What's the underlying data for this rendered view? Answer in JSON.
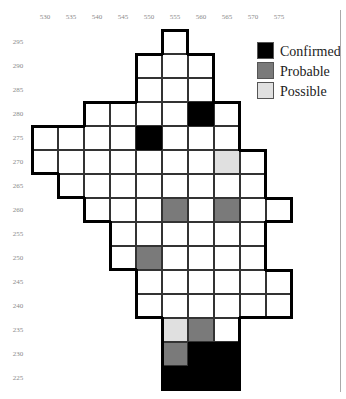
{
  "chart_data": {
    "type": "heatmap",
    "title": "",
    "xlabel": "",
    "ylabel": "",
    "x_ticks": [
      530,
      535,
      540,
      545,
      550,
      555,
      560,
      565,
      570,
      575
    ],
    "y_ticks": [
      295,
      290,
      285,
      280,
      275,
      270,
      265,
      260,
      255,
      250,
      245,
      240,
      235,
      230,
      225
    ],
    "grid": true,
    "legend_position": "top-right",
    "legend": [
      {
        "label": "Confirmed",
        "color": "#000000",
        "key": "confirmed"
      },
      {
        "label": "Probable",
        "color": "#7a7a7a",
        "key": "probable"
      },
      {
        "label": "Possible",
        "color": "#e0e0e0",
        "key": "possible"
      }
    ],
    "rows": [
      {
        "y": 295,
        "cells": [
          {
            "x": 555,
            "s": "none"
          }
        ]
      },
      {
        "y": 290,
        "cells": [
          {
            "x": 550,
            "s": "none"
          },
          {
            "x": 555,
            "s": "none"
          },
          {
            "x": 560,
            "s": "none"
          }
        ]
      },
      {
        "y": 285,
        "cells": [
          {
            "x": 550,
            "s": "none"
          },
          {
            "x": 555,
            "s": "none"
          },
          {
            "x": 560,
            "s": "none"
          }
        ]
      },
      {
        "y": 280,
        "cells": [
          {
            "x": 540,
            "s": "none"
          },
          {
            "x": 545,
            "s": "none"
          },
          {
            "x": 550,
            "s": "none"
          },
          {
            "x": 555,
            "s": "none"
          },
          {
            "x": 560,
            "s": "confirmed"
          },
          {
            "x": 565,
            "s": "none"
          }
        ]
      },
      {
        "y": 275,
        "cells": [
          {
            "x": 530,
            "s": "none"
          },
          {
            "x": 535,
            "s": "none"
          },
          {
            "x": 540,
            "s": "none"
          },
          {
            "x": 545,
            "s": "none"
          },
          {
            "x": 550,
            "s": "confirmed"
          },
          {
            "x": 555,
            "s": "none"
          },
          {
            "x": 560,
            "s": "none"
          },
          {
            "x": 565,
            "s": "none"
          }
        ]
      },
      {
        "y": 270,
        "cells": [
          {
            "x": 530,
            "s": "none"
          },
          {
            "x": 535,
            "s": "none"
          },
          {
            "x": 540,
            "s": "none"
          },
          {
            "x": 545,
            "s": "none"
          },
          {
            "x": 550,
            "s": "none"
          },
          {
            "x": 555,
            "s": "none"
          },
          {
            "x": 560,
            "s": "none"
          },
          {
            "x": 565,
            "s": "possible"
          },
          {
            "x": 570,
            "s": "none"
          }
        ]
      },
      {
        "y": 265,
        "cells": [
          {
            "x": 535,
            "s": "none"
          },
          {
            "x": 540,
            "s": "none"
          },
          {
            "x": 545,
            "s": "none"
          },
          {
            "x": 550,
            "s": "none"
          },
          {
            "x": 555,
            "s": "none"
          },
          {
            "x": 560,
            "s": "none"
          },
          {
            "x": 565,
            "s": "none"
          },
          {
            "x": 570,
            "s": "none"
          }
        ]
      },
      {
        "y": 260,
        "cells": [
          {
            "x": 540,
            "s": "none"
          },
          {
            "x": 545,
            "s": "none"
          },
          {
            "x": 550,
            "s": "none"
          },
          {
            "x": 555,
            "s": "probable"
          },
          {
            "x": 560,
            "s": "none"
          },
          {
            "x": 565,
            "s": "probable"
          },
          {
            "x": 570,
            "s": "none"
          },
          {
            "x": 575,
            "s": "none"
          }
        ]
      },
      {
        "y": 255,
        "cells": [
          {
            "x": 545,
            "s": "none"
          },
          {
            "x": 550,
            "s": "none"
          },
          {
            "x": 555,
            "s": "none"
          },
          {
            "x": 560,
            "s": "none"
          },
          {
            "x": 565,
            "s": "none"
          },
          {
            "x": 570,
            "s": "none"
          }
        ]
      },
      {
        "y": 250,
        "cells": [
          {
            "x": 545,
            "s": "none"
          },
          {
            "x": 550,
            "s": "probable"
          },
          {
            "x": 555,
            "s": "none"
          },
          {
            "x": 560,
            "s": "none"
          },
          {
            "x": 565,
            "s": "none"
          },
          {
            "x": 570,
            "s": "none"
          }
        ]
      },
      {
        "y": 245,
        "cells": [
          {
            "x": 550,
            "s": "none"
          },
          {
            "x": 555,
            "s": "none"
          },
          {
            "x": 560,
            "s": "none"
          },
          {
            "x": 565,
            "s": "none"
          },
          {
            "x": 570,
            "s": "none"
          },
          {
            "x": 575,
            "s": "none"
          }
        ]
      },
      {
        "y": 240,
        "cells": [
          {
            "x": 550,
            "s": "none"
          },
          {
            "x": 555,
            "s": "none"
          },
          {
            "x": 560,
            "s": "none"
          },
          {
            "x": 565,
            "s": "none"
          },
          {
            "x": 570,
            "s": "none"
          },
          {
            "x": 575,
            "s": "none"
          }
        ]
      },
      {
        "y": 235,
        "cells": [
          {
            "x": 555,
            "s": "possible"
          },
          {
            "x": 560,
            "s": "probable"
          },
          {
            "x": 565,
            "s": "none"
          }
        ]
      },
      {
        "y": 230,
        "cells": [
          {
            "x": 555,
            "s": "probable"
          },
          {
            "x": 560,
            "s": "confirmed"
          },
          {
            "x": 565,
            "s": "confirmed"
          }
        ]
      },
      {
        "y": 225,
        "cells": [
          {
            "x": 555,
            "s": "confirmed"
          },
          {
            "x": 560,
            "s": "confirmed"
          },
          {
            "x": 565,
            "s": "confirmed"
          }
        ]
      }
    ]
  },
  "colors": {
    "none": "#ffffff",
    "confirmed": "#000000",
    "probable": "#7a7a7a",
    "possible": "#e0e0e0",
    "gridline": "#333333",
    "outline": "#000000",
    "tick": "#8a8a8a"
  }
}
